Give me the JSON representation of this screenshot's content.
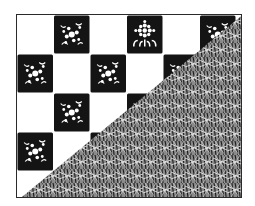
{
  "illustration": {
    "subject": "checkerboard of floral tiles with diagonal hatched triangle",
    "colors": {
      "ink": "#141414",
      "paper": "#ffffff",
      "border": "#2a2a2a"
    },
    "grid": {
      "columns": 6,
      "rows": 5,
      "cell_width": 36.5,
      "cell_height": 39
    },
    "tiles": [
      {
        "row": 0,
        "col": 1,
        "motif": "flower-cluster"
      },
      {
        "row": 0,
        "col": 3,
        "motif": "sunflower"
      },
      {
        "row": 0,
        "col": 5,
        "motif": "flower-sprig"
      },
      {
        "row": 1,
        "col": 0,
        "motif": "flower-cluster"
      },
      {
        "row": 1,
        "col": 2,
        "motif": "flower-cluster"
      },
      {
        "row": 1,
        "col": 4,
        "motif": "flower-sprig"
      },
      {
        "row": 2,
        "col": 1,
        "motif": "flower-cluster"
      },
      {
        "row": 2,
        "col": 3,
        "motif": "flower-cluster"
      },
      {
        "row": 3,
        "col": 0,
        "motif": "flower-cluster"
      },
      {
        "row": 3,
        "col": 2,
        "motif": "flower-cluster"
      },
      {
        "row": 4,
        "col": 1,
        "motif": "flower-cluster"
      }
    ],
    "overlay": {
      "shape": "triangle",
      "from": "bottom-left",
      "to": "top-right",
      "fill": "hatched-lines"
    }
  }
}
